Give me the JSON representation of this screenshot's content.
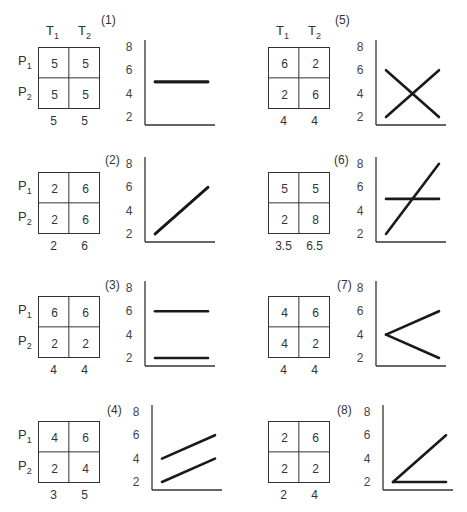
{
  "column_labels": {
    "t1": "T",
    "t1_sub": "1",
    "t2": "T",
    "t2_sub": "2"
  },
  "row_labels": {
    "p1": "P",
    "p1_sub": "1",
    "p2": "P",
    "p2_sub": "2"
  },
  "y_ticks": [
    "8",
    "6",
    "4",
    "2"
  ],
  "panels": [
    {
      "id": "(1)",
      "cells": [
        "5",
        "5",
        "5",
        "5"
      ],
      "means": [
        "5",
        "5"
      ],
      "show_headers": true,
      "show_rows": true
    },
    {
      "id": "(2)",
      "cells": [
        "2",
        "6",
        "2",
        "6"
      ],
      "means": [
        "2",
        "6"
      ],
      "show_headers": false,
      "show_rows": true
    },
    {
      "id": "(3)",
      "cells": [
        "6",
        "6",
        "2",
        "2"
      ],
      "means": [
        "4",
        "4"
      ],
      "show_headers": false,
      "show_rows": true
    },
    {
      "id": "(4)",
      "cells": [
        "4",
        "6",
        "2",
        "4"
      ],
      "means": [
        "3",
        "5"
      ],
      "show_headers": false,
      "show_rows": true
    },
    {
      "id": "(5)",
      "cells": [
        "6",
        "2",
        "2",
        "6"
      ],
      "means": [
        "4",
        "4"
      ],
      "show_headers": true,
      "show_rows": false
    },
    {
      "id": "(6)",
      "cells": [
        "5",
        "5",
        "2",
        "8"
      ],
      "means": [
        "3.5",
        "6.5"
      ],
      "show_headers": false,
      "show_rows": false
    },
    {
      "id": "(7)",
      "cells": [
        "4",
        "6",
        "4",
        "2"
      ],
      "means": [
        "4",
        "4"
      ],
      "show_headers": false,
      "show_rows": false
    },
    {
      "id": "(8)",
      "cells": [
        "2",
        "6",
        "2",
        "2"
      ],
      "means": [
        "2",
        "4"
      ],
      "show_headers": false,
      "show_rows": false
    }
  ],
  "chart_data": [
    {
      "type": "line",
      "title": "(1)",
      "ylim": [
        1.5,
        8.5
      ],
      "yticks": [
        2,
        4,
        6,
        8
      ],
      "x": [
        "T1",
        "T2"
      ],
      "series": [
        {
          "name": "P1",
          "values": [
            5,
            5
          ]
        },
        {
          "name": "P2",
          "values": [
            5,
            5
          ]
        }
      ]
    },
    {
      "type": "line",
      "title": "(2)",
      "ylim": [
        1.5,
        8.5
      ],
      "yticks": [
        2,
        4,
        6,
        8
      ],
      "x": [
        "T1",
        "T2"
      ],
      "series": [
        {
          "name": "P1",
          "values": [
            2,
            6
          ]
        },
        {
          "name": "P2",
          "values": [
            2,
            6
          ]
        }
      ]
    },
    {
      "type": "line",
      "title": "(3)",
      "ylim": [
        1.5,
        8.5
      ],
      "yticks": [
        2,
        4,
        6,
        8
      ],
      "x": [
        "T1",
        "T2"
      ],
      "series": [
        {
          "name": "P1",
          "values": [
            6,
            6
          ]
        },
        {
          "name": "P2",
          "values": [
            2,
            2
          ]
        }
      ]
    },
    {
      "type": "line",
      "title": "(4)",
      "ylim": [
        1.5,
        8.5
      ],
      "yticks": [
        2,
        4,
        6,
        8
      ],
      "x": [
        "T1",
        "T2"
      ],
      "series": [
        {
          "name": "P1",
          "values": [
            4,
            6
          ]
        },
        {
          "name": "P2",
          "values": [
            2,
            4
          ]
        }
      ]
    },
    {
      "type": "line",
      "title": "(5)",
      "ylim": [
        1.5,
        8.5
      ],
      "yticks": [
        2,
        4,
        6,
        8
      ],
      "x": [
        "T1",
        "T2"
      ],
      "series": [
        {
          "name": "P1",
          "values": [
            6,
            2
          ]
        },
        {
          "name": "P2",
          "values": [
            2,
            6
          ]
        }
      ]
    },
    {
      "type": "line",
      "title": "(6)",
      "ylim": [
        1.5,
        8.5
      ],
      "yticks": [
        2,
        4,
        6,
        8
      ],
      "x": [
        "T1",
        "T2"
      ],
      "series": [
        {
          "name": "P1",
          "values": [
            5,
            5
          ]
        },
        {
          "name": "P2",
          "values": [
            2,
            8
          ]
        }
      ]
    },
    {
      "type": "line",
      "title": "(7)",
      "ylim": [
        1.5,
        8.5
      ],
      "yticks": [
        2,
        4,
        6,
        8
      ],
      "x": [
        "T1",
        "T2"
      ],
      "series": [
        {
          "name": "P1",
          "values": [
            4,
            6
          ]
        },
        {
          "name": "P2",
          "values": [
            4,
            2
          ]
        }
      ]
    },
    {
      "type": "line",
      "title": "(8)",
      "ylim": [
        1.5,
        8.5
      ],
      "yticks": [
        2,
        4,
        6,
        8
      ],
      "x": [
        "T1",
        "T2"
      ],
      "series": [
        {
          "name": "P1",
          "values": [
            2,
            6
          ]
        },
        {
          "name": "P2",
          "values": [
            2,
            2
          ]
        }
      ]
    }
  ]
}
